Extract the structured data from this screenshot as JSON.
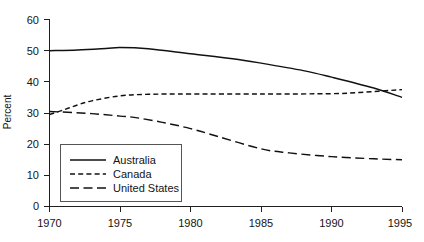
{
  "chart_data": {
    "type": "line",
    "title": "",
    "xlabel": "",
    "ylabel": "Percent",
    "xlim": [
      1970,
      1995
    ],
    "ylim": [
      0,
      60
    ],
    "grid": false,
    "legend_position": "lower-left-inside",
    "x_ticks": [
      "1970",
      "1975",
      "1980",
      "1985",
      "1990",
      "1995"
    ],
    "y_ticks": [
      "0",
      "10",
      "20",
      "30",
      "40",
      "50",
      "60"
    ],
    "x": [
      1970,
      1975,
      1980,
      1985,
      1990,
      1995
    ],
    "series": [
      {
        "name": "Australia",
        "style": "solid",
        "values": [
          50,
          51,
          49,
          46,
          41.5,
          35
        ],
        "points": [
          {
            "x": 1970,
            "y": 50
          },
          {
            "x": 1972,
            "y": 50.2
          },
          {
            "x": 1974,
            "y": 50.7
          },
          {
            "x": 1975,
            "y": 51
          },
          {
            "x": 1977,
            "y": 50.6
          },
          {
            "x": 1980,
            "y": 49
          },
          {
            "x": 1983,
            "y": 47.4
          },
          {
            "x": 1985,
            "y": 46
          },
          {
            "x": 1988,
            "y": 43.6
          },
          {
            "x": 1990,
            "y": 41.5
          },
          {
            "x": 1993,
            "y": 38
          },
          {
            "x": 1995,
            "y": 35
          }
        ]
      },
      {
        "name": "Canada",
        "style": "short-dash",
        "values": [
          29.5,
          35.5,
          36,
          36,
          36,
          37.5
        ],
        "points": [
          {
            "x": 1970,
            "y": 29.5
          },
          {
            "x": 1971,
            "y": 31
          },
          {
            "x": 1972,
            "y": 32.6
          },
          {
            "x": 1973,
            "y": 33.9
          },
          {
            "x": 1975,
            "y": 35.5
          },
          {
            "x": 1977,
            "y": 36
          },
          {
            "x": 1980,
            "y": 36.1
          },
          {
            "x": 1985,
            "y": 36.1
          },
          {
            "x": 1990,
            "y": 36.2
          },
          {
            "x": 1992,
            "y": 36.6
          },
          {
            "x": 1995,
            "y": 37.5
          }
        ]
      },
      {
        "name": "United States",
        "style": "long-dash",
        "values": [
          30.5,
          29,
          25,
          18.5,
          16,
          15
        ],
        "points": [
          {
            "x": 1970,
            "y": 30.5
          },
          {
            "x": 1973,
            "y": 29.8
          },
          {
            "x": 1975,
            "y": 29
          },
          {
            "x": 1976,
            "y": 28.6
          },
          {
            "x": 1978,
            "y": 27
          },
          {
            "x": 1980,
            "y": 25
          },
          {
            "x": 1982,
            "y": 22.4
          },
          {
            "x": 1985,
            "y": 18.5
          },
          {
            "x": 1987,
            "y": 17.2
          },
          {
            "x": 1990,
            "y": 16
          },
          {
            "x": 1993,
            "y": 15.3
          },
          {
            "x": 1995,
            "y": 15
          }
        ]
      }
    ],
    "legend_entries": [
      "Australia",
      "Canada",
      "United States"
    ]
  }
}
